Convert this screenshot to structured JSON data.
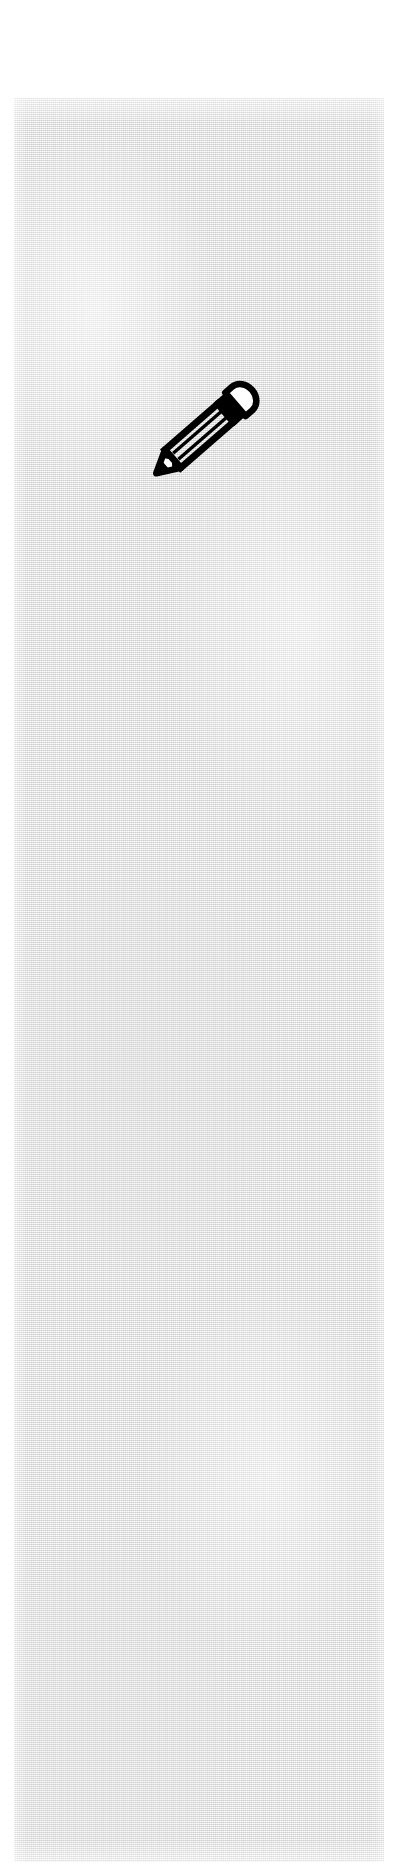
{
  "document": {
    "kind": "scanned-page",
    "page_background_color": "#ffffff",
    "paper_color": "#ebebeb",
    "ink_color": "#000000",
    "text_content": "",
    "notes_visible": ""
  },
  "paper_panel": {
    "label": "scanned paper area",
    "texture": "halftone-dither-grain"
  },
  "icon": {
    "name": "pencil-icon",
    "label": "pencil",
    "alt_label": "edit",
    "style": "black outline line-art",
    "orientation": "diagonal, tip lower-left",
    "fill_color": "#000000",
    "highlight_color": "#ffffff",
    "parts": {
      "eraser_cap": "eraser",
      "ferrule": "ferrule band",
      "barrel": "barrel",
      "wood_tip": "sharpened wood",
      "graphite_point": "graphite point"
    }
  }
}
